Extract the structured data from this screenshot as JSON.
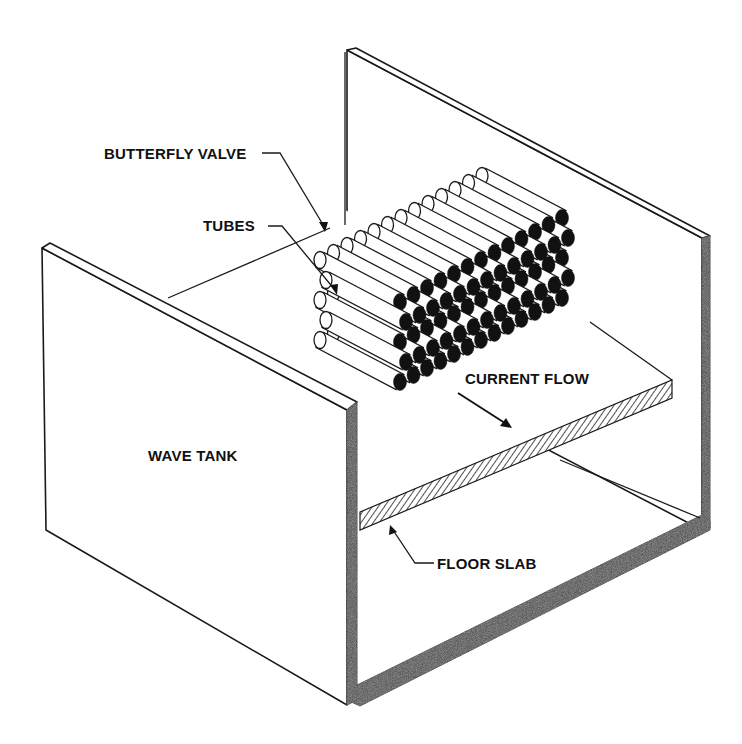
{
  "figure": {
    "type": "isometric schematic"
  },
  "labels": {
    "butterfly_valve": "BUTTERFLY VALVE",
    "tubes": "TUBES",
    "current_flow": "CURRENT FLOW",
    "wave_tank": "WAVE TANK",
    "floor_slab": "FLOOR SLAB"
  },
  "tube_bundle": {
    "rows_visible": 5,
    "columns_visible": 13,
    "end_fill_color": "#111111"
  },
  "colors": {
    "line": "#1a1a1a",
    "wall_section": "#3a3a3a",
    "background": "#ffffff"
  }
}
